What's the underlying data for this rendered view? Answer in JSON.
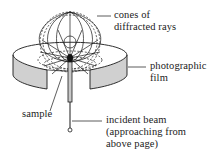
{
  "diagram": {
    "labels": {
      "cones": [
        "cones of",
        "diffracted rays"
      ],
      "film": [
        "photographic",
        "film"
      ],
      "sample": "sample",
      "beam": [
        "incident beam",
        "(approaching from",
        "above page)"
      ]
    },
    "colors": {
      "line": "#1a1a1a",
      "film_fill": "#d0d0d0",
      "background": "#ffffff"
    }
  }
}
